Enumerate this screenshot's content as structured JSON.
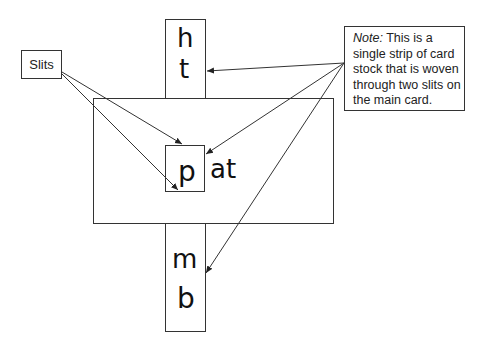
{
  "diagram": {
    "type": "annotated illustration",
    "labels": {
      "slits": "Slits",
      "note_prefix": "Note:",
      "note_body": " This is a single strip of card stock that is woven through two slits on the main card."
    },
    "strip_letters": {
      "top_1": "h",
      "top_2": "t",
      "middle": "p",
      "bottom_1": "m",
      "bottom_2": "b"
    },
    "main_card_text": "at",
    "colors": {
      "line": "#333333",
      "text": "#111111",
      "background": "#ffffff"
    }
  }
}
